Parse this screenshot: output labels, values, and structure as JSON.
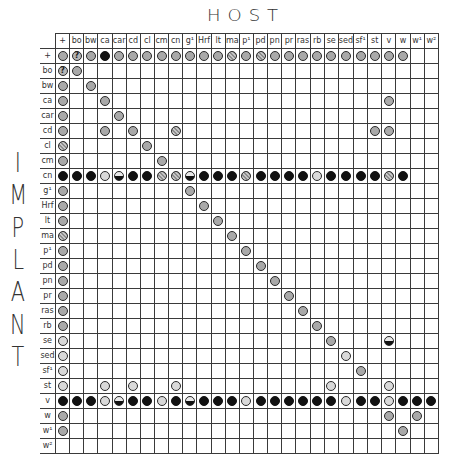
{
  "title": {
    "host": "HOST",
    "implant": [
      "I",
      "M",
      "P",
      "L",
      "A",
      "N",
      "T"
    ]
  },
  "legend_codes": {
    "g": "gray circle",
    "s": "hatched gray circle",
    "l": "light circle",
    "b": "black circle",
    "h": "half-filled circle (black lower half)",
    "q": "circle with question mark"
  },
  "columns": [
    "+",
    "bo",
    "bw",
    "ca",
    "car",
    "cd",
    "cl",
    "cm",
    "cn",
    "g¹",
    "Hrf",
    "lt",
    "ma",
    "p¹",
    "pd",
    "pn",
    "pr",
    "ras",
    "rb",
    "se",
    "sed",
    "sf¹",
    "st",
    "v",
    "w",
    "w¹",
    "w²"
  ],
  "rows": [
    {
      "label": "+",
      "cells": [
        "g",
        "q",
        "g",
        "b",
        "g",
        "g",
        "g",
        "g",
        "g",
        "g",
        "g",
        "g",
        "s",
        "g",
        "s",
        "g",
        "g",
        "g",
        "g",
        "g",
        "g",
        "g",
        "g",
        "g",
        "g",
        "",
        ""
      ]
    },
    {
      "label": "bo",
      "cells": [
        "q",
        "g",
        "",
        "",
        "",
        "",
        "",
        "",
        "",
        "",
        "",
        "",
        "",
        "",
        "",
        "",
        "",
        "",
        "",
        "",
        "",
        "",
        "",
        "",
        "",
        "",
        ""
      ]
    },
    {
      "label": "bw",
      "cells": [
        "g",
        "",
        "g",
        "",
        "",
        "",
        "",
        "",
        "",
        "",
        "",
        "",
        "",
        "",
        "",
        "",
        "",
        "",
        "",
        "",
        "",
        "",
        "",
        "",
        "",
        "",
        ""
      ]
    },
    {
      "label": "ca",
      "cells": [
        "g",
        "",
        "",
        "g",
        "",
        "",
        "",
        "",
        "",
        "",
        "",
        "",
        "",
        "",
        "",
        "",
        "",
        "",
        "",
        "",
        "",
        "",
        "",
        "g",
        "",
        "",
        ""
      ]
    },
    {
      "label": "car",
      "cells": [
        "g",
        "",
        "",
        "",
        "g",
        "",
        "",
        "",
        "",
        "",
        "",
        "",
        "",
        "",
        "",
        "",
        "",
        "",
        "",
        "",
        "",
        "",
        "",
        "",
        "",
        "",
        ""
      ]
    },
    {
      "label": "cd",
      "cells": [
        "g",
        "",
        "",
        "g",
        "",
        "g",
        "",
        "",
        "s",
        "",
        "",
        "",
        "",
        "",
        "",
        "",
        "",
        "",
        "",
        "",
        "",
        "",
        "g",
        "g",
        "",
        "",
        ""
      ]
    },
    {
      "label": "cl",
      "cells": [
        "s",
        "",
        "",
        "",
        "",
        "",
        "g",
        "",
        "",
        "",
        "",
        "",
        "",
        "",
        "",
        "",
        "",
        "",
        "",
        "",
        "",
        "",
        "",
        "",
        "",
        "",
        ""
      ]
    },
    {
      "label": "cm",
      "cells": [
        "g",
        "",
        "",
        "",
        "",
        "",
        "",
        "g",
        "",
        "",
        "",
        "",
        "",
        "",
        "",
        "",
        "",
        "",
        "",
        "",
        "",
        "",
        "",
        "",
        "",
        "",
        ""
      ]
    },
    {
      "label": "cn",
      "cells": [
        "b",
        "b",
        "b",
        "l",
        "h",
        "b",
        "b",
        "s",
        "s",
        "h",
        "b",
        "b",
        "b",
        "s",
        "b",
        "b",
        "b",
        "b",
        "l",
        "b",
        "b",
        "b",
        "b",
        "s",
        "b",
        "",
        ""
      ]
    },
    {
      "label": "g¹",
      "cells": [
        "g",
        "",
        "",
        "",
        "",
        "",
        "",
        "",
        "",
        "g",
        "",
        "",
        "",
        "",
        "",
        "",
        "",
        "",
        "",
        "",
        "",
        "",
        "",
        "",
        "",
        "",
        ""
      ]
    },
    {
      "label": "Hrf",
      "cells": [
        "g",
        "",
        "",
        "",
        "",
        "",
        "",
        "",
        "",
        "",
        "g",
        "",
        "",
        "",
        "",
        "",
        "",
        "",
        "",
        "",
        "",
        "",
        "",
        "",
        "",
        "",
        ""
      ]
    },
    {
      "label": "lt",
      "cells": [
        "g",
        "",
        "",
        "",
        "",
        "",
        "",
        "",
        "",
        "",
        "",
        "g",
        "",
        "",
        "",
        "",
        "",
        "",
        "",
        "",
        "",
        "",
        "",
        "",
        "",
        "",
        ""
      ]
    },
    {
      "label": "ma",
      "cells": [
        "s",
        "",
        "",
        "",
        "",
        "",
        "",
        "",
        "",
        "",
        "",
        "",
        "g",
        "",
        "",
        "",
        "",
        "",
        "",
        "",
        "",
        "",
        "",
        "",
        "",
        "",
        ""
      ]
    },
    {
      "label": "p¹",
      "cells": [
        "g",
        "",
        "",
        "",
        "",
        "",
        "",
        "",
        "",
        "",
        "",
        "",
        "",
        "g",
        "",
        "",
        "",
        "",
        "",
        "",
        "",
        "",
        "",
        "",
        "",
        "",
        ""
      ]
    },
    {
      "label": "pd",
      "cells": [
        "g",
        "",
        "",
        "",
        "",
        "",
        "",
        "",
        "",
        "",
        "",
        "",
        "",
        "",
        "g",
        "",
        "",
        "",
        "",
        "",
        "",
        "",
        "",
        "",
        "",
        "",
        ""
      ]
    },
    {
      "label": "pn",
      "cells": [
        "g",
        "",
        "",
        "",
        "",
        "",
        "",
        "",
        "",
        "",
        "",
        "",
        "",
        "",
        "",
        "g",
        "",
        "",
        "",
        "",
        "",
        "",
        "",
        "",
        "",
        "",
        ""
      ]
    },
    {
      "label": "pr",
      "cells": [
        "g",
        "",
        "",
        "",
        "",
        "",
        "",
        "",
        "",
        "",
        "",
        "",
        "",
        "",
        "",
        "",
        "g",
        "",
        "",
        "",
        "",
        "",
        "",
        "",
        "",
        "",
        ""
      ]
    },
    {
      "label": "ras",
      "cells": [
        "g",
        "",
        "",
        "",
        "",
        "",
        "",
        "",
        "",
        "",
        "",
        "",
        "",
        "",
        "",
        "",
        "",
        "g",
        "",
        "",
        "",
        "",
        "",
        "",
        "",
        "",
        ""
      ]
    },
    {
      "label": "rb",
      "cells": [
        "g",
        "",
        "",
        "",
        "",
        "",
        "",
        "",
        "",
        "",
        "",
        "",
        "",
        "",
        "",
        "",
        "",
        "",
        "g",
        "",
        "",
        "",
        "",
        "",
        "",
        "",
        ""
      ]
    },
    {
      "label": "se",
      "cells": [
        "l",
        "",
        "",
        "",
        "",
        "",
        "",
        "",
        "",
        "",
        "",
        "",
        "",
        "",
        "",
        "",
        "",
        "",
        "",
        "g",
        "",
        "",
        "",
        "h",
        "",
        "",
        ""
      ]
    },
    {
      "label": "sed",
      "cells": [
        "l",
        "",
        "",
        "",
        "",
        "",
        "",
        "",
        "",
        "",
        "",
        "",
        "",
        "",
        "",
        "",
        "",
        "",
        "",
        "",
        "l",
        "",
        "",
        "",
        "",
        "",
        ""
      ]
    },
    {
      "label": "sf¹",
      "cells": [
        "l",
        "",
        "",
        "",
        "",
        "",
        "",
        "",
        "",
        "",
        "",
        "",
        "",
        "",
        "",
        "",
        "",
        "",
        "",
        "",
        "",
        "g",
        "",
        "",
        "",
        "",
        ""
      ]
    },
    {
      "label": "st",
      "cells": [
        "l",
        "",
        "",
        "l",
        "",
        "l",
        "",
        "",
        "l",
        "",
        "",
        "",
        "",
        "",
        "",
        "",
        "",
        "",
        "",
        "l",
        "",
        "",
        "",
        "l",
        "",
        "",
        ""
      ]
    },
    {
      "label": "v",
      "cells": [
        "b",
        "b",
        "b",
        "l",
        "h",
        "b",
        "b",
        "l",
        "b",
        "h",
        "b",
        "b",
        "b",
        "l",
        "b",
        "b",
        "b",
        "b",
        "b",
        "b",
        "l",
        "b",
        "b",
        "l",
        "b",
        "b",
        "b"
      ]
    },
    {
      "label": "w",
      "cells": [
        "g",
        "",
        "",
        "",
        "",
        "",
        "",
        "",
        "",
        "",
        "",
        "",
        "",
        "",
        "",
        "",
        "",
        "",
        "",
        "",
        "",
        "",
        "",
        "g",
        "",
        "g",
        ""
      ]
    },
    {
      "label": "w¹",
      "cells": [
        "g",
        "",
        "",
        "",
        "",
        "",
        "",
        "",
        "",
        "",
        "",
        "",
        "",
        "",
        "",
        "",
        "",
        "",
        "",
        "",
        "",
        "",
        "",
        "",
        "g",
        "",
        ""
      ]
    },
    {
      "label": "w²",
      "cells": [
        "",
        "",
        "",
        "",
        "",
        "",
        "",
        "",
        "",
        "",
        "",
        "",
        "",
        "",
        "",
        "",
        "",
        "",
        "",
        "",
        "",
        "",
        "",
        "",
        "",
        "",
        ""
      ]
    }
  ]
}
